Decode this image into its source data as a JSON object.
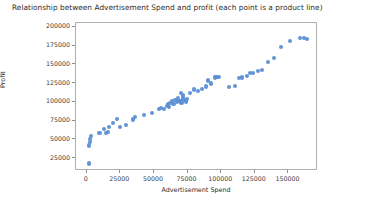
{
  "chart_data": {
    "type": "scatter",
    "title": "Relationship between Advertisement Spend and profit (each point is a product line)",
    "xlabel": "Advertisement Spend",
    "ylabel": "Profit",
    "xlim": [
      -8000,
      172000
    ],
    "ylim": [
      8000,
      205000
    ],
    "grid": false,
    "legend": null,
    "marker_color": "#5b8ed4",
    "xticks": [
      0,
      25000,
      50000,
      75000,
      100000,
      125000,
      150000
    ],
    "xtick_labels": [
      "0",
      "25000",
      "50000",
      "75000",
      "100000",
      "125000",
      "150000"
    ],
    "yticks": [
      25000,
      50000,
      75000,
      100000,
      125000,
      150000,
      175000,
      200000
    ],
    "ytick_labels": [
      "25000",
      "50000",
      "75000",
      "100000",
      "125000",
      "150000",
      "175000",
      "200000"
    ],
    "series": [
      {
        "name": "product lines",
        "points": [
          [
            1500,
            18000
          ],
          [
            2000,
            42000
          ],
          [
            2200,
            46500
          ],
          [
            2400,
            50500
          ],
          [
            3000,
            55000
          ],
          [
            9500,
            58000
          ],
          [
            12500,
            63500
          ],
          [
            14000,
            58500
          ],
          [
            15500,
            60500
          ],
          [
            16500,
            66500
          ],
          [
            19500,
            71500
          ],
          [
            22500,
            77000
          ],
          [
            24500,
            66000
          ],
          [
            29500,
            69000
          ],
          [
            34500,
            76500
          ],
          [
            36000,
            80000
          ],
          [
            42500,
            82500
          ],
          [
            48500,
            85500
          ],
          [
            53500,
            90500
          ],
          [
            55500,
            92000
          ],
          [
            57500,
            91000
          ],
          [
            59500,
            95000
          ],
          [
            60500,
            97000
          ],
          [
            61000,
            93500
          ],
          [
            62000,
            99000
          ],
          [
            63500,
            101000
          ],
          [
            64500,
            97500
          ],
          [
            66000,
            103000
          ],
          [
            67000,
            99500
          ],
          [
            68000,
            105500
          ],
          [
            69000,
            101500
          ],
          [
            70000,
            100500
          ],
          [
            70500,
            99000
          ],
          [
            71500,
            104500
          ],
          [
            72500,
            102000
          ],
          [
            73500,
            100500
          ],
          [
            74500,
            103500
          ],
          [
            70000,
            112000
          ],
          [
            71500,
            108500
          ],
          [
            76500,
            111500
          ],
          [
            79500,
            116500
          ],
          [
            82500,
            114500
          ],
          [
            85500,
            117000
          ],
          [
            88500,
            120500
          ],
          [
            90500,
            128500
          ],
          [
            92500,
            124500
          ],
          [
            95500,
            132500
          ],
          [
            96500,
            133500
          ],
          [
            98500,
            133000
          ],
          [
            105500,
            119500
          ],
          [
            110500,
            121000
          ],
          [
            113500,
            131500
          ],
          [
            115500,
            132500
          ],
          [
            119500,
            134000
          ],
          [
            121500,
            138500
          ],
          [
            123500,
            138000
          ],
          [
            127500,
            141500
          ],
          [
            130500,
            143000
          ],
          [
            134500,
            153000
          ],
          [
            139500,
            158500
          ],
          [
            144500,
            172500
          ],
          [
            151500,
            181500
          ],
          [
            158500,
            184500
          ],
          [
            161500,
            185000
          ],
          [
            163500,
            184000
          ]
        ]
      }
    ]
  }
}
